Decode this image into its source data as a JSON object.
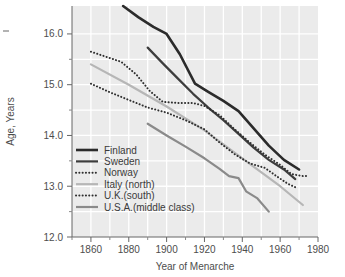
{
  "chart_data": {
    "type": "line",
    "title": "",
    "xlabel": "Year of Menarche",
    "ylabel": "Age, Years",
    "xlim": [
      1850,
      1980
    ],
    "ylim": [
      12.0,
      16.55
    ],
    "grid": true,
    "grid_color": "#ffffff",
    "plot_background": "#ebebeb",
    "legend_position": "lower-left-inside",
    "x_ticks_major": [
      1860,
      1880,
      1900,
      1920,
      1940,
      1960,
      1980
    ],
    "x_ticks_minor": [
      1850,
      1870,
      1890,
      1910,
      1930,
      1950,
      1970
    ],
    "y_ticks_major": [
      12.0,
      13.0,
      14.0,
      15.0,
      16.0
    ],
    "y_ticks_minor": [
      12.5,
      13.5,
      14.5,
      15.5
    ],
    "x_tick_labels": [
      "1860",
      "1880",
      "1900",
      "1920",
      "1940",
      "1960",
      "1980"
    ],
    "y_tick_labels": [
      "12.0",
      "13.0",
      "14.0",
      "15.0",
      "16.0"
    ],
    "series": [
      {
        "name": "Finland",
        "legend_label": "Finland",
        "color": "#2b2b2b",
        "width": 2.6,
        "dash": "none",
        "points": [
          [
            1877,
            16.55
          ],
          [
            1885,
            16.33
          ],
          [
            1893,
            16.14
          ],
          [
            1900,
            16.0
          ],
          [
            1907,
            15.6
          ],
          [
            1915,
            15.02
          ],
          [
            1922,
            14.86
          ],
          [
            1930,
            14.68
          ],
          [
            1938,
            14.48
          ],
          [
            1946,
            14.14
          ],
          [
            1954,
            13.8
          ],
          [
            1962,
            13.52
          ],
          [
            1970,
            13.33
          ]
        ]
      },
      {
        "name": "Sweden",
        "legend_label": "Sweden",
        "color": "#3d3d3d",
        "width": 2.2,
        "dash": "none",
        "points": [
          [
            1890,
            15.73
          ],
          [
            1898,
            15.42
          ],
          [
            1906,
            15.12
          ],
          [
            1914,
            14.82
          ],
          [
            1922,
            14.55
          ],
          [
            1930,
            14.3
          ],
          [
            1938,
            14.03
          ],
          [
            1946,
            13.76
          ],
          [
            1954,
            13.52
          ],
          [
            1962,
            13.33
          ],
          [
            1968,
            13.14
          ]
        ]
      },
      {
        "name": "Norway",
        "legend_label": "Norway",
        "color": "#2f2f2f",
        "width": 2.0,
        "dash": "dotted",
        "points": [
          [
            1860,
            15.65
          ],
          [
            1868,
            15.55
          ],
          [
            1876,
            15.45
          ],
          [
            1884,
            15.2
          ],
          [
            1891,
            14.88
          ],
          [
            1898,
            14.66
          ],
          [
            1906,
            14.64
          ],
          [
            1914,
            14.64
          ],
          [
            1920,
            14.58
          ],
          [
            1928,
            14.4
          ],
          [
            1936,
            14.12
          ],
          [
            1944,
            13.86
          ],
          [
            1952,
            13.62
          ],
          [
            1960,
            13.42
          ],
          [
            1966,
            13.24
          ],
          [
            1972,
            13.2
          ],
          [
            1975,
            13.2
          ]
        ]
      },
      {
        "name": "Italy (north)",
        "legend_label": "Italy (north)",
        "color": "#b6b6b6",
        "width": 2.2,
        "dash": "none",
        "points": [
          [
            1860,
            15.4
          ],
          [
            1880,
            15.0
          ],
          [
            1900,
            14.57
          ],
          [
            1920,
            14.1
          ],
          [
            1940,
            13.55
          ],
          [
            1960,
            13.0
          ],
          [
            1972,
            12.63
          ]
        ]
      },
      {
        "name": "U.K.(south)",
        "legend_label": "U.K.(south)",
        "color": "#2f2f2f",
        "width": 2.0,
        "dash": "dotted",
        "points": [
          [
            1860,
            15.02
          ],
          [
            1870,
            14.85
          ],
          [
            1880,
            14.7
          ],
          [
            1890,
            14.55
          ],
          [
            1900,
            14.45
          ],
          [
            1910,
            14.3
          ],
          [
            1920,
            14.12
          ],
          [
            1928,
            13.86
          ],
          [
            1936,
            13.63
          ],
          [
            1944,
            13.45
          ],
          [
            1952,
            13.36
          ],
          [
            1958,
            13.2
          ],
          [
            1964,
            13.05
          ],
          [
            1968,
            12.98
          ]
        ]
      },
      {
        "name": "U.S.A.(middle class)",
        "legend_label": "U.S.A.(middle class)",
        "color": "#8a8a8a",
        "width": 2.2,
        "dash": "none",
        "points": [
          [
            1890,
            14.23
          ],
          [
            1900,
            14.0
          ],
          [
            1910,
            13.78
          ],
          [
            1920,
            13.55
          ],
          [
            1928,
            13.34
          ],
          [
            1933,
            13.2
          ],
          [
            1938,
            13.16
          ],
          [
            1942,
            12.9
          ],
          [
            1948,
            12.76
          ],
          [
            1954,
            12.5
          ]
        ]
      }
    ]
  },
  "legend": {
    "entries": [
      {
        "label": "Finland"
      },
      {
        "label": "Sweden"
      },
      {
        "label": "Norway"
      },
      {
        "label": "Italy (north)"
      },
      {
        "label": "U.K.(south)"
      },
      {
        "label": "U.S.A.(middle class)"
      }
    ]
  }
}
